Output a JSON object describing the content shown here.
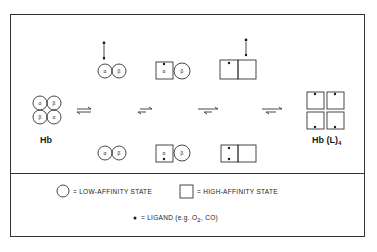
{
  "diagram": {
    "start_label": "Hb",
    "end_label_main": "Hb (L)",
    "end_label_sub": "4",
    "subunit_alpha": "α",
    "subunit_beta": "β",
    "equilibrium_symbol": "⇌"
  },
  "legend": {
    "low_affinity": "= LOW-AFFINITY STATE",
    "high_affinity": "= HIGH-AFFINITY STATE",
    "ligand_prefix": "= LIGAND (e.g. O",
    "ligand_sub": "2",
    "ligand_suffix": ", CO)"
  },
  "colors": {
    "line": "#333333",
    "background": "#ffffff"
  }
}
